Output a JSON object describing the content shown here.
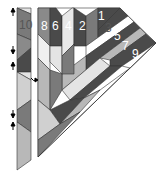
{
  "diagram": {
    "type": "quilt-assembly",
    "strip_labels": [
      "10",
      "8",
      "6",
      "4",
      "2",
      "1",
      "3",
      "5",
      "7",
      "9"
    ],
    "colors": {
      "dark": "#4a4a4a",
      "mid": "#7a7a7a",
      "light": "#b8b8b8",
      "pale": "#e4e4e4",
      "white": "#ffffff",
      "stroke": "#333333"
    },
    "arrows": [
      "up",
      "down",
      "up",
      "down",
      "up"
    ]
  }
}
